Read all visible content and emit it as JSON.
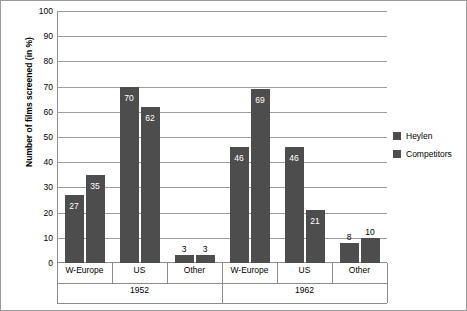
{
  "chart_data": {
    "type": "bar",
    "title": "",
    "xlabel": "",
    "ylabel": "Number of films screened (in %)",
    "ylim": [
      0,
      100
    ],
    "ytick_step": 10,
    "yticks": [
      "0",
      "10",
      "20",
      "30",
      "40",
      "50",
      "60",
      "70",
      "80",
      "90",
      "100"
    ],
    "grid": true,
    "legend_position": "right",
    "groups": [
      {
        "name": "1952",
        "categories": [
          "W-Europe",
          "US",
          "Other"
        ]
      },
      {
        "name": "1962",
        "categories": [
          "W-Europe",
          "US",
          "Other"
        ]
      }
    ],
    "categories": [
      "W-Europe",
      "US",
      "Other",
      "W-Europe",
      "US",
      "Other"
    ],
    "series": [
      {
        "name": "Heylen",
        "values": [
          27,
          70,
          3,
          46,
          46,
          8
        ],
        "labels": [
          "27",
          "70",
          "3",
          "46",
          "46",
          "8"
        ]
      },
      {
        "name": "Competitors",
        "values": [
          35,
          62,
          3,
          69,
          21,
          10
        ],
        "labels": [
          "35",
          "62",
          "3",
          "69",
          "21",
          "10"
        ]
      }
    ],
    "bar_color": "#4d4d4d",
    "grid_color": "#9d9d9d"
  },
  "legend": {
    "items": [
      {
        "label": "Heylen"
      },
      {
        "label": "Competitors"
      }
    ]
  }
}
